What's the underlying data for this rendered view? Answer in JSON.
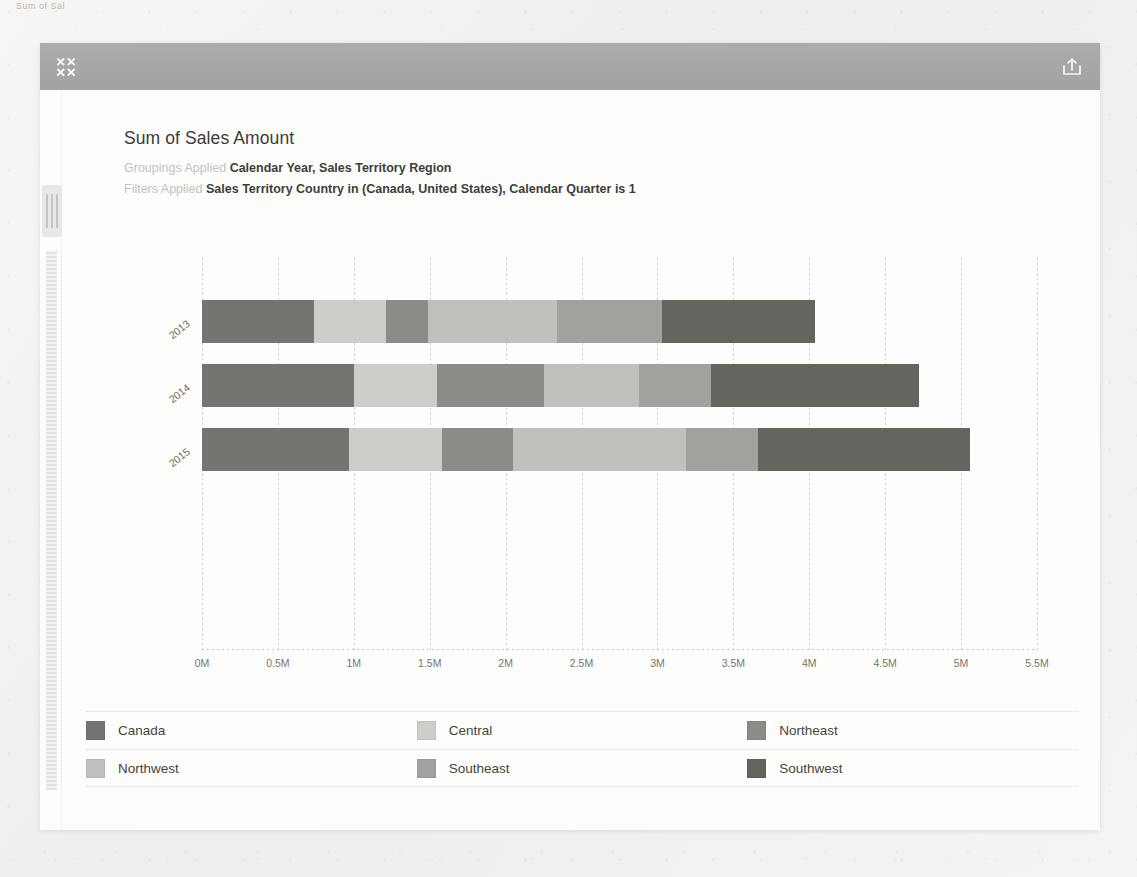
{
  "corner_text": "Sum of Sal",
  "header": {
    "collapse_icon": "collapse-arrows-icon",
    "share_icon": "share-export-icon"
  },
  "report": {
    "title": "Sum of Sales Amount",
    "groupings_label": "Groupings Applied",
    "groupings_value": "Calendar Year, Sales Territory Region",
    "filters_label": "Filters Applied",
    "filters_value": "Sales Territory Country in (Canada, United States), Calendar Quarter is 1"
  },
  "legend": {
    "items": [
      {
        "label": "Canada",
        "color": "#767471"
      },
      {
        "label": "Central",
        "color": "#cfcdc9"
      },
      {
        "label": "Northeast",
        "color": "#8d8b87"
      },
      {
        "label": "Northwest",
        "color": "#c2c0bc"
      },
      {
        "label": "Southeast",
        "color": "#a3a19d"
      },
      {
        "label": "Southwest",
        "color": "#66645f"
      }
    ]
  },
  "chart_data": {
    "type": "bar",
    "orientation": "horizontal",
    "stacked": true,
    "title": "Sum of Sales Amount",
    "xlabel": "",
    "ylabel": "",
    "categories": [
      "2013",
      "2014",
      "2015"
    ],
    "xticks": [
      "0M",
      "0.5M",
      "1M",
      "1.5M",
      "2M",
      "2.5M",
      "3M",
      "3.5M",
      "4M",
      "4.5M",
      "5M",
      "5.5M"
    ],
    "xtick_values": [
      0,
      0.5,
      1,
      1.5,
      2,
      2.5,
      3,
      3.5,
      4,
      4.5,
      5,
      5.5
    ],
    "xlim": [
      0,
      5.5
    ],
    "xunit": "M",
    "grid": true,
    "legend_position": "bottom",
    "series": [
      {
        "name": "Canada",
        "color": "#767471",
        "values": [
          0.74,
          1.0,
          0.97
        ]
      },
      {
        "name": "Central",
        "color": "#cfcdc9",
        "values": [
          0.47,
          0.55,
          0.61
        ]
      },
      {
        "name": "Northeast",
        "color": "#8d8b87",
        "values": [
          0.28,
          0.7,
          0.47
        ]
      },
      {
        "name": "Northwest",
        "color": "#c2c0bc",
        "values": [
          0.85,
          0.63,
          1.14
        ]
      },
      {
        "name": "Southeast",
        "color": "#a3a19d",
        "values": [
          0.69,
          0.47,
          0.47
        ]
      },
      {
        "name": "Southwest",
        "color": "#66645f",
        "values": [
          1.01,
          1.37,
          1.4
        ]
      }
    ],
    "totals": [
      4.04,
      4.72,
      5.06
    ]
  }
}
